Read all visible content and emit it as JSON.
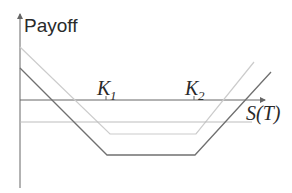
{
  "diagram": {
    "y_axis_label": "Payoff",
    "x_axis_label": "S(T)",
    "strikes": [
      {
        "letter": "K",
        "subscript": "1"
      },
      {
        "letter": "K",
        "subscript": "2"
      }
    ],
    "colors": {
      "axis": "#666666",
      "dark_line": "#6e6e6e",
      "light_line": "#c8c8c8",
      "mid_line": "#b4b4b4",
      "text": "#2a2a2a"
    }
  }
}
